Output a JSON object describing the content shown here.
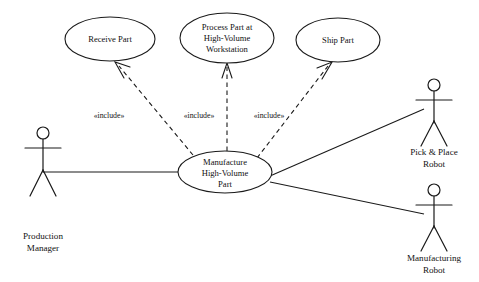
{
  "diagram": {
    "type": "uml-use-case-diagram",
    "background_color": "#ffffff",
    "stroke_color": "#1a1a1a",
    "text_color": "#111111"
  },
  "use_cases": [
    {
      "id": "receive-part",
      "lines": [
        "Receive Part"
      ],
      "cx": 110,
      "cy": 39,
      "rx": 45,
      "ry": 22
    },
    {
      "id": "process-part",
      "lines": [
        "Process Part at",
        "High-Volume",
        "Workstation"
      ],
      "cx": 227,
      "cy": 38,
      "rx": 47,
      "ry": 25
    },
    {
      "id": "ship-part",
      "lines": [
        "Ship Part"
      ],
      "cx": 338,
      "cy": 40,
      "rx": 42,
      "ry": 22
    },
    {
      "id": "manufacture-high-volume-part",
      "lines": [
        "Manufacture",
        "High-Volume",
        "Part"
      ],
      "cx": 225,
      "cy": 172,
      "rx": 47,
      "ry": 21
    }
  ],
  "actors": [
    {
      "id": "production-manager",
      "lines": [
        "Production",
        "Manager"
      ],
      "head_cx": 43,
      "head_cy": 133,
      "head_r": 6,
      "label_x": 43,
      "label_y": 249
    },
    {
      "id": "pick-and-place-robot",
      "lines": [
        "Pick & Place",
        "Robot"
      ],
      "head_cx": 434,
      "head_cy": 85,
      "head_r": 6,
      "label_x": 434,
      "label_y": 155
    },
    {
      "id": "manufacturing-robot",
      "lines": [
        "Manufacturing",
        "Robot"
      ],
      "head_cx": 434,
      "head_cy": 190,
      "head_r": 6,
      "label_x": 434,
      "label_y": 260
    }
  ],
  "relationships": [
    {
      "id": "include-receive-part",
      "kind": "include",
      "stereotype": "«include»",
      "label_x": 109,
      "label_y": 118,
      "from": {
        "x": 193,
        "y": 155
      },
      "to": {
        "x": 116,
        "y": 63
      }
    },
    {
      "id": "include-process-part",
      "kind": "include",
      "stereotype": "«include»",
      "label_x": 199,
      "label_y": 118,
      "from": {
        "x": 227,
        "y": 151
      },
      "to": {
        "x": 227,
        "y": 64
      }
    },
    {
      "id": "include-ship-part",
      "kind": "include",
      "stereotype": "«include»",
      "label_x": 269,
      "label_y": 118,
      "from": {
        "x": 257,
        "y": 158
      },
      "to": {
        "x": 331,
        "y": 63
      }
    },
    {
      "id": "assoc-production-manager",
      "kind": "association",
      "from": {
        "x": 43,
        "y": 172
      },
      "to": {
        "x": 178,
        "y": 172
      }
    },
    {
      "id": "assoc-pick-and-place-robot",
      "kind": "association",
      "from": {
        "x": 270,
        "y": 176
      },
      "to": {
        "x": 424,
        "y": 109
      }
    },
    {
      "id": "assoc-manufacturing-robot",
      "kind": "association",
      "from": {
        "x": 270,
        "y": 182
      },
      "to": {
        "x": 424,
        "y": 214
      }
    }
  ]
}
